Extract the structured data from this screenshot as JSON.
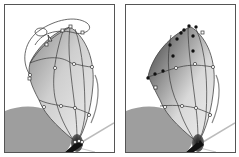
{
  "figure": {
    "panels": [
      {
        "id": "left",
        "description": "gradient mesh wing with selection lasso and direct-selection cursor",
        "tool": "lasso-icon",
        "cursor": "direct-selection-icon"
      },
      {
        "id": "right",
        "description": "gradient mesh wing with selected mesh points shown as filled anchors"
      }
    ],
    "colors": {
      "frame": "#555555",
      "wing_light": "#e6e6e6",
      "wing_dark": "#6e6e6e",
      "mesh_line": "#3a3a3a",
      "shadow_shape": "#9a9a9a",
      "body": "#1a1a1a"
    }
  }
}
